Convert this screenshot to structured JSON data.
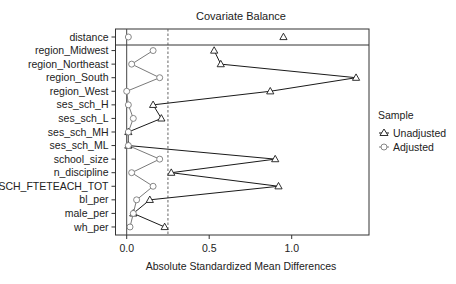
{
  "chart_data": {
    "type": "line",
    "subtype": "love-plot",
    "title": "Covariate Balance",
    "xlabel": "Absolute Standardized Mean Differences",
    "ylabel": "",
    "xlim": [
      -0.07,
      1.47
    ],
    "xticks": [
      0.0,
      0.5,
      1.0
    ],
    "xtick_labels": [
      "0.0",
      "0.5",
      "1.0"
    ],
    "threshold": 0.25,
    "grid": false,
    "legend_position": "right",
    "legend_title": "Sample",
    "categories": [
      "distance",
      "region_Midwest",
      "region_Northeast",
      "region_South",
      "region_West",
      "ses_sch_H",
      "ses_sch_L",
      "ses_sch_MH",
      "ses_sch_ML",
      "school_size",
      "n_discipline",
      "SCH_FTETEACH_TOT",
      "bl_per",
      "male_per",
      "wh_per"
    ],
    "series": [
      {
        "name": "Unadjusted",
        "marker": "triangle",
        "values": [
          0.95,
          0.53,
          0.57,
          1.39,
          0.87,
          0.16,
          0.21,
          0.01,
          0.01,
          0.9,
          0.27,
          0.92,
          0.14,
          0.04,
          0.23
        ]
      },
      {
        "name": "Adjusted",
        "marker": "circle",
        "values": [
          0.01,
          0.16,
          0.03,
          0.2,
          0.0,
          0.01,
          0.04,
          0.01,
          0.01,
          0.2,
          0.03,
          0.16,
          0.06,
          0.04,
          0.02
        ]
      }
    ],
    "separate_first_row": true
  },
  "colors": {
    "unadjusted_line": "#1a1a1a",
    "adjusted_line": "#7a7a7a",
    "axis": "#333333",
    "threshold": "#555555"
  }
}
